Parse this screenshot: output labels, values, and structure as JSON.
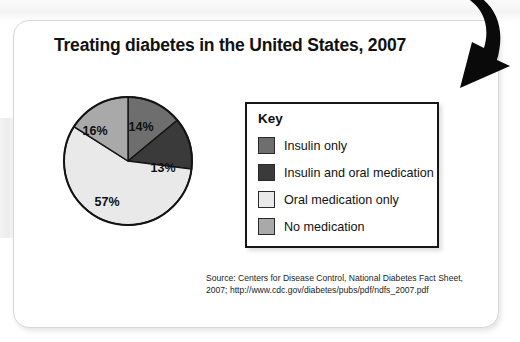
{
  "figure": {
    "title": "Treating diabetes in the United States, 2007",
    "source_line_1": "Source: Centers for Disease Control, National Diabetes Fact Sheet,",
    "source_line_2": "2007; http://www.cdc.gov/diabetes/pubs/pdf/ndfs_2007.pdf"
  },
  "legend": {
    "title": "Key",
    "items": [
      {
        "label": "Insulin only",
        "color": "#6e6e6e"
      },
      {
        "label": "Insulin and oral medication",
        "color": "#3a3a3a"
      },
      {
        "label": "Oral medication only",
        "color": "#e9e9e9"
      },
      {
        "label": "No medication",
        "color": "#a9a9a9"
      }
    ]
  },
  "annotation": {
    "arrow": "curved-down-arrow"
  },
  "chart_data": {
    "type": "pie",
    "title": "Treating diabetes in the United States, 2007",
    "categories": [
      "Insulin only",
      "Insulin and oral medication",
      "Oral medication only",
      "No medication"
    ],
    "values": [
      14,
      13,
      57,
      16
    ],
    "value_labels": [
      "14%",
      "13%",
      "57%",
      "16%"
    ],
    "colors": [
      "#6e6e6e",
      "#3a3a3a",
      "#e9e9e9",
      "#a9a9a9"
    ],
    "units": "percent",
    "start_angle_deg": 0,
    "direction": "clockwise",
    "legend_position": "right",
    "grid": false,
    "label_positions": [
      {
        "label": "14%",
        "x": 79,
        "y": 36
      },
      {
        "label": "13%",
        "x": 101,
        "y": 77
      },
      {
        "label": "57%",
        "x": 45,
        "y": 111
      },
      {
        "label": "16%",
        "x": 33,
        "y": 40
      }
    ]
  }
}
